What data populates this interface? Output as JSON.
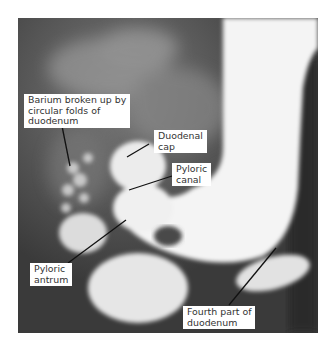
{
  "figure": {
    "type": "barium-radiograph",
    "labels": [
      {
        "id": "barium",
        "text": "Barium broken up by\ncircular folds of\nduodenum"
      },
      {
        "id": "duodenal-cap",
        "text": "Duodenal\ncap"
      },
      {
        "id": "pyloric-canal",
        "text": "Pyloric\ncanal"
      },
      {
        "id": "pyloric-antrum",
        "text": "Pyloric\nantrum"
      },
      {
        "id": "fourth-part",
        "text": "Fourth part of\nduodenum"
      }
    ]
  },
  "colors": {
    "background": "#ffffff",
    "film_dark": "#3a3a3a",
    "barium": "#f4f4f4",
    "label_bg": "#ffffff",
    "label_text": "#333333",
    "leader_line": "#111111"
  }
}
